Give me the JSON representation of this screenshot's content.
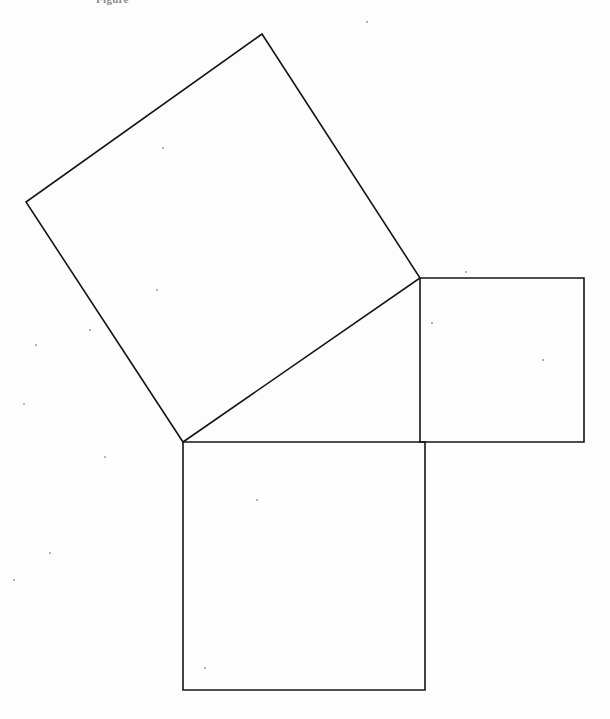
{
  "page": {
    "width": 610,
    "height": 719,
    "background_color": "#fdfdfd",
    "ink_color": "#151515",
    "media": "scanned line drawing"
  },
  "caption": {
    "text": "Figure",
    "note": "partially cropped text along the very top edge of the scan"
  },
  "figure": {
    "name": "pythagoras-squares",
    "stroke_color": "#151515",
    "stroke_width": 1.6,
    "fill_color": "none",
    "triangle": {
      "name": "right-triangle",
      "vertices": [
        {
          "label": "A",
          "x": 183,
          "y": 442
        },
        {
          "label": "B",
          "x": 420,
          "y": 278
        },
        {
          "label": "C",
          "x": 420,
          "y": 442
        }
      ],
      "right_angle_at": "C"
    },
    "shapes": [
      {
        "name": "hypotenuse-square",
        "position": "upper-left",
        "orientation": "tilted",
        "side_px": 288,
        "points": "262,34 420,278 183,442 26,202"
      },
      {
        "name": "vertical-leg-square",
        "position": "right",
        "orientation": "axis-aligned",
        "side_px": 164,
        "points": "420,278 584,278 584,442 420,442"
      },
      {
        "name": "horizontal-leg-square",
        "position": "bottom",
        "orientation": "axis-aligned",
        "side_px": 243,
        "points": "183,442 425,442 425,690 183,690"
      }
    ]
  },
  "specks": [
    {
      "x": 163,
      "y": 148,
      "r": 1.1
    },
    {
      "x": 36,
      "y": 345,
      "r": 1.2
    },
    {
      "x": 157,
      "y": 290,
      "r": 1.0
    },
    {
      "x": 24,
      "y": 404,
      "r": 1.0
    },
    {
      "x": 105,
      "y": 457,
      "r": 1.3
    },
    {
      "x": 50,
      "y": 553,
      "r": 1.0
    },
    {
      "x": 257,
      "y": 500,
      "r": 1.1
    },
    {
      "x": 205,
      "y": 668,
      "r": 1.0
    },
    {
      "x": 466,
      "y": 272,
      "r": 1.0
    },
    {
      "x": 543,
      "y": 360,
      "r": 1.0
    },
    {
      "x": 432,
      "y": 323,
      "r": 0.9
    },
    {
      "x": 367,
      "y": 22,
      "r": 1.0
    },
    {
      "x": 14,
      "y": 580,
      "r": 0.9
    },
    {
      "x": 90,
      "y": 330,
      "r": 0.9
    }
  ]
}
